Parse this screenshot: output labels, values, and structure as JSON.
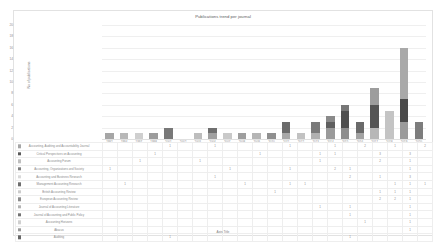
{
  "chart_data": {
    "type": "bar",
    "stacked": true,
    "title": "Publications trend per journal",
    "xlabel": "Axis Title",
    "ylabel": "No of publications",
    "ylim": [
      0,
      20
    ],
    "ytick_labels": [
      "20",
      "18",
      "16",
      "14",
      "12",
      "10",
      "8",
      "6",
      "4",
      "2",
      "0"
    ],
    "grid": true,
    "legend_position": "table-below",
    "categories": [
      "1992",
      "1994",
      "1997",
      "1998",
      "2001",
      "2002",
      "2003",
      "2004",
      "2007",
      "2008",
      "2009",
      "2010",
      "2011",
      "2012",
      "2013",
      "2014",
      "2015",
      "2016",
      "2017",
      "2018",
      "2019",
      "2020"
    ],
    "series": [
      {
        "name": "Accounting, Auditing and Accountability Journal",
        "color": "#a6a6a6",
        "values": [
          "",
          "",
          "",
          "",
          "1",
          "",
          "",
          "1",
          "",
          "",
          "",
          "",
          "1",
          "",
          "",
          "1",
          "",
          "2",
          "",
          "1",
          "",
          "2"
        ]
      },
      {
        "name": "Critical Perspectives on Accounting",
        "color": "#595959",
        "values": [
          "",
          "",
          "",
          "1",
          "",
          "",
          "",
          "",
          "",
          "",
          "1",
          "",
          "",
          "",
          "1",
          "1",
          "",
          "",
          "3",
          "",
          "3",
          ""
        ]
      },
      {
        "name": "Accounting Forum",
        "color": "#bfbfbf",
        "values": [
          "",
          "",
          "1",
          "",
          "",
          "",
          "1",
          "",
          "",
          "",
          "",
          "",
          "",
          "",
          "1",
          "",
          "",
          "",
          "2",
          "",
          "1",
          ""
        ]
      },
      {
        "name": "Accounting, Organizations and Society",
        "color": "#7f7f7f",
        "values": [
          "1",
          "",
          "",
          "",
          "",
          "",
          "",
          "",
          "1",
          "",
          "",
          "",
          "1",
          "",
          "",
          "2",
          "1",
          "",
          "",
          "",
          "1",
          ""
        ]
      },
      {
        "name": "Accounting and Business Research",
        "color": "#d9d9d9",
        "values": [
          "",
          "",
          "",
          "",
          "",
          "",
          "",
          "1",
          "",
          "",
          "",
          "",
          "",
          "",
          "",
          "",
          "2",
          "",
          "1",
          "",
          "3",
          ""
        ]
      },
      {
        "name": "Management Accounting Research",
        "color": "#6e6e6e",
        "values": [
          "",
          "1",
          "",
          "",
          "",
          "",
          "",
          "",
          "",
          "1",
          "",
          "",
          "1",
          "1",
          "",
          "",
          "",
          "",
          "",
          "1",
          "1",
          "1"
        ]
      },
      {
        "name": "British Accounting Review",
        "color": "#cccccc",
        "values": [
          "",
          "",
          "",
          "",
          "",
          "",
          "",
          "",
          "",
          "",
          "",
          "1",
          "",
          "",
          "",
          "",
          "",
          "",
          "1",
          "1",
          "1",
          ""
        ]
      },
      {
        "name": "European Accounting Review",
        "color": "#8c8c8c",
        "values": [
          "",
          "",
          "",
          "",
          "",
          "",
          "",
          "",
          "",
          "",
          "",
          "",
          "",
          "",
          "",
          "",
          "",
          "",
          "2",
          "2",
          "1",
          ""
        ]
      },
      {
        "name": "Journal of Accounting Literature",
        "color": "#b3b3b3",
        "values": [
          "",
          "",
          "",
          "",
          "",
          "",
          "",
          "",
          "",
          "",
          "",
          "",
          "",
          "",
          "1",
          "",
          "1",
          "",
          "",
          "",
          "1",
          ""
        ]
      },
      {
        "name": "Journal of Accounting and Public Policy",
        "color": "#737373",
        "values": [
          "",
          "",
          "",
          "",
          "",
          "",
          "",
          "",
          "",
          "",
          "",
          "",
          "",
          "",
          "",
          "",
          "1",
          "",
          "",
          "",
          "1",
          ""
        ]
      },
      {
        "name": "Accounting Horizons",
        "color": "#d0d0d0",
        "values": [
          "",
          "",
          "",
          "",
          "",
          "",
          "",
          "",
          "",
          "",
          "",
          "",
          "",
          "",
          "",
          "",
          "",
          "1",
          "",
          "",
          "1",
          ""
        ]
      },
      {
        "name": "Abacus",
        "color": "#9a9a9a",
        "values": [
          "",
          "",
          "",
          "",
          "",
          "",
          "",
          "",
          "",
          "",
          "",
          "",
          "",
          "",
          "",
          "",
          "",
          "",
          "",
          "",
          "1",
          ""
        ]
      },
      {
        "name": "Auditing",
        "color": "#666666",
        "values": [
          "",
          "",
          "",
          "",
          "1",
          "",
          "",
          "",
          "",
          "",
          "",
          "",
          "",
          "",
          "",
          "",
          "1",
          "",
          "",
          "",
          "",
          ""
        ]
      }
    ],
    "bar_totals": [
      1,
      1,
      1,
      1,
      2,
      0,
      1,
      2,
      1,
      1,
      1,
      1,
      3,
      1,
      3,
      4,
      6,
      3,
      9,
      5,
      16,
      3
    ],
    "bar_stacks": [
      [
        {
          "c": "#a6a6a6",
          "v": 1
        }
      ],
      [
        {
          "c": "#b8b8b8",
          "v": 1
        }
      ],
      [
        {
          "c": "#cfcfcf",
          "v": 1
        }
      ],
      [
        {
          "c": "#9c9c9c",
          "v": 1
        }
      ],
      [
        {
          "c": "#787878",
          "v": 2
        }
      ],
      [],
      [
        {
          "c": "#bdbdbd",
          "v": 1
        }
      ],
      [
        {
          "c": "#a0a0a0",
          "v": 1
        },
        {
          "c": "#6f6f6f",
          "v": 1
        }
      ],
      [
        {
          "c": "#c9c9c9",
          "v": 1
        }
      ],
      [
        {
          "c": "#9e9e9e",
          "v": 1
        }
      ],
      [
        {
          "c": "#b5b5b5",
          "v": 1
        }
      ],
      [
        {
          "c": "#8f8f8f",
          "v": 1
        }
      ],
      [
        {
          "c": "#a8a8a8",
          "v": 1
        },
        {
          "c": "#6b6b6b",
          "v": 2
        }
      ],
      [
        {
          "c": "#c2c2c2",
          "v": 1
        }
      ],
      [
        {
          "c": "#b0b0b0",
          "v": 1
        },
        {
          "c": "#7a7a7a",
          "v": 2
        }
      ],
      [
        {
          "c": "#9a9a9a",
          "v": 2
        },
        {
          "c": "#5f5f5f",
          "v": 1
        },
        {
          "c": "#8a8a8a",
          "v": 1
        }
      ],
      [
        {
          "c": "#8e8e8e",
          "v": 2
        },
        {
          "c": "#4f4f4f",
          "v": 3
        },
        {
          "c": "#777777",
          "v": 1
        }
      ],
      [
        {
          "c": "#a3a3a3",
          "v": 1
        },
        {
          "c": "#6a6a6a",
          "v": 2
        }
      ],
      [
        {
          "c": "#b7b7b7",
          "v": 2
        },
        {
          "c": "#555555",
          "v": 4
        },
        {
          "c": "#9d9d9d",
          "v": 3
        }
      ],
      [
        {
          "c": "#c4c4c4",
          "v": 5
        }
      ],
      [
        {
          "c": "#9b9b9b",
          "v": 3
        },
        {
          "c": "#4a4a4a",
          "v": 4
        },
        {
          "c": "#a9a9a9",
          "v": 9
        }
      ],
      [
        {
          "c": "#7d7d7d",
          "v": 3
        }
      ]
    ]
  }
}
